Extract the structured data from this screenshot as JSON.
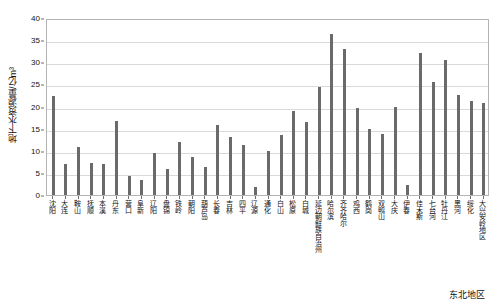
{
  "chart_data": {
    "type": "bar",
    "title": "",
    "xlabel": "东北地区",
    "ylabel": "地下水资源量/亿m³",
    "ylim": [
      0,
      40
    ],
    "yticks": [
      0,
      5,
      10,
      15,
      20,
      25,
      30,
      35,
      40
    ],
    "grid": true,
    "legend": false,
    "bar_color": "#6a6a6a",
    "categories": [
      "沈阳",
      "大连",
      "鞍山",
      "抚顺",
      "本溪",
      "丹东",
      "营口",
      "阜新",
      "辽阳",
      "盘锦",
      "铁岭",
      "朝阳",
      "葫芦岛",
      "长春",
      "吉林",
      "四平",
      "辽源",
      "通化",
      "白山",
      "松原",
      "白城",
      "延边朝鲜族自治州",
      "哈尔滨",
      "齐齐哈尔",
      "鸡西",
      "鹤岗",
      "双鸭山",
      "大庆",
      "伊春",
      "佳木斯",
      "七台河",
      "牡丹江",
      "黑河",
      "绥化",
      "大兴安岭地区"
    ],
    "values": [
      22.3,
      7.0,
      10.8,
      7.3,
      6.9,
      16.7,
      4.3,
      3.4,
      9.6,
      5.9,
      11.9,
      8.5,
      6.3,
      15.9,
      13.2,
      11.4,
      1.8,
      9.9,
      13.6,
      18.9,
      16.5,
      24.4,
      36.3,
      33.0,
      19.7,
      14.9,
      13.8,
      19.9,
      2.2,
      32.1,
      25.6,
      30.6,
      22.6,
      21.2,
      20.9
    ]
  }
}
